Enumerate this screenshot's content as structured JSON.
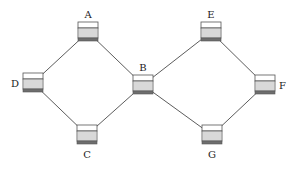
{
  "diagram": {
    "type": "network-topology",
    "node_icon": "server-rack-icon",
    "nodes": [
      {
        "id": "A",
        "label": "A",
        "x": 88,
        "y": 32,
        "label_pos": "top"
      },
      {
        "id": "B",
        "label": "B",
        "x": 143,
        "y": 85,
        "label_pos": "top"
      },
      {
        "id": "C",
        "label": "C",
        "x": 87,
        "y": 135,
        "label_pos": "bottom"
      },
      {
        "id": "D",
        "label": "D",
        "x": 33,
        "y": 83,
        "label_pos": "left"
      },
      {
        "id": "E",
        "label": "E",
        "x": 211,
        "y": 32,
        "label_pos": "top"
      },
      {
        "id": "F",
        "label": "F",
        "x": 265,
        "y": 85,
        "label_pos": "right"
      },
      {
        "id": "G",
        "label": "G",
        "x": 212,
        "y": 135,
        "label_pos": "bottom"
      }
    ],
    "edges": [
      {
        "from": "D",
        "to": "A"
      },
      {
        "from": "A",
        "to": "B"
      },
      {
        "from": "D",
        "to": "C"
      },
      {
        "from": "C",
        "to": "B"
      },
      {
        "from": "B",
        "to": "E"
      },
      {
        "from": "E",
        "to": "F"
      },
      {
        "from": "B",
        "to": "G"
      },
      {
        "from": "G",
        "to": "F"
      }
    ]
  }
}
